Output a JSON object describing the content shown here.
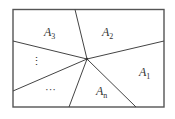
{
  "diagram": {
    "stroke_color": "#444444",
    "regions": [
      {
        "name": "A",
        "sub": "1"
      },
      {
        "name": "A",
        "sub": "2"
      },
      {
        "name": "A",
        "sub": "3"
      },
      {
        "name": "A",
        "sub": "n"
      }
    ],
    "ellipsis_vertical": "⋮",
    "ellipsis_horizontal": "···"
  }
}
